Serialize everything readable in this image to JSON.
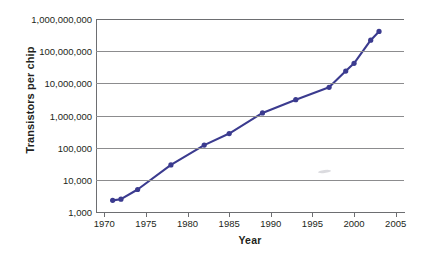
{
  "chart_data": {
    "type": "line",
    "title": "",
    "xlabel": "Year",
    "ylabel": "Transistors per chip",
    "xlim": [
      1969,
      2006
    ],
    "ylim": [
      1000,
      1000000000
    ],
    "yscale": "log",
    "grid": true,
    "legend": false,
    "line_color": "#3b3b8f",
    "marker_color": "#3b3b8f",
    "gridline_color": "#8c8c8e",
    "axis_color": "#6d6e71",
    "text_color": "#231f20",
    "background": "#ffffff",
    "x": [
      1971,
      1972,
      1974,
      1978,
      1982,
      1985,
      1989,
      1993,
      1997,
      1999,
      2000,
      2002,
      2003
    ],
    "y": [
      2300,
      2500,
      5000,
      29000,
      120000,
      275000,
      1200000,
      3100000,
      7500000,
      24000000,
      42000000,
      220000000,
      410000000
    ],
    "xticks": [
      1970,
      1975,
      1980,
      1985,
      1990,
      1995,
      2000,
      2005
    ],
    "xtick_labels": [
      "1970",
      "1975",
      "1980",
      "1985",
      "1990",
      "1995",
      "2000",
      "2005"
    ],
    "yticks": [
      1000,
      10000,
      100000,
      1000000,
      10000000,
      100000000,
      1000000000
    ],
    "ytick_labels": [
      "1,000",
      "10,000",
      "100,000",
      "1,000,000",
      "10,000,000",
      "100,000,000",
      "1,000,000,000"
    ]
  }
}
